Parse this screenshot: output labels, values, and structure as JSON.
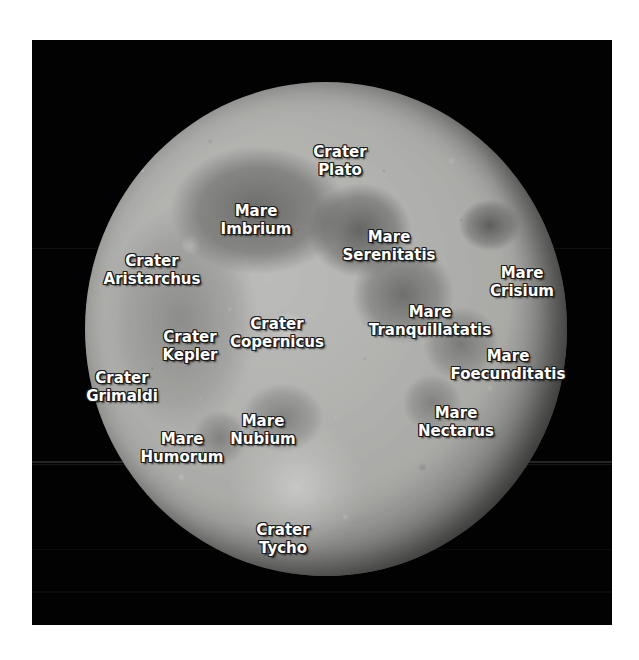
{
  "image": {
    "subject": "Moon",
    "view": "near side, full moon",
    "background_color": "#020202",
    "page_color": "#ffffff",
    "label_color": "#ffffff",
    "label_outline_color": "#1c1c1c",
    "disc_color": "#a9a9a6",
    "maria_color": "#5a5a58"
  },
  "labels": [
    {
      "kind": "Crater",
      "name": "Plato",
      "full": "Crater Plato",
      "x": 340,
      "y": 143
    },
    {
      "kind": "Mare",
      "name": "Imbrium",
      "full": "Mare Imbrium",
      "x": 256,
      "y": 202
    },
    {
      "kind": "Mare",
      "name": "Serenitatis",
      "full": "Mare Serenitatis",
      "x": 389,
      "y": 228
    },
    {
      "kind": "Crater",
      "name": "Aristarchus",
      "full": "Crater Aristarchus",
      "x": 152,
      "y": 252
    },
    {
      "kind": "Mare",
      "name": "Crisium",
      "full": "Mare Crisium",
      "x": 522,
      "y": 264
    },
    {
      "kind": "Mare",
      "name": "Tranquillatatis",
      "full": "Mare Tranquillatatis",
      "x": 430,
      "y": 303
    },
    {
      "kind": "Crater",
      "name": "Copernicus",
      "full": "Crater Copernicus",
      "x": 277,
      "y": 315
    },
    {
      "kind": "Crater",
      "name": "Kepler",
      "full": "Crater Kepler",
      "x": 190,
      "y": 328
    },
    {
      "kind": "Mare",
      "name": "Foecunditatis",
      "full": "Mare Foecunditatis",
      "x": 508,
      "y": 347
    },
    {
      "kind": "Crater",
      "name": "Grimaldi",
      "full": "Crater Grimaldi",
      "x": 122,
      "y": 369
    },
    {
      "kind": "Mare",
      "name": "Nectarus",
      "full": "Mare Nectarus",
      "x": 456,
      "y": 404
    },
    {
      "kind": "Mare",
      "name": "Nubium",
      "full": "Mare Nubium",
      "x": 263,
      "y": 412
    },
    {
      "kind": "Mare",
      "name": "Humorum",
      "full": "Mare Humorum",
      "x": 182,
      "y": 430
    },
    {
      "kind": "Crater",
      "name": "Tycho",
      "full": "Crater Tycho",
      "x": 283,
      "y": 521
    }
  ]
}
